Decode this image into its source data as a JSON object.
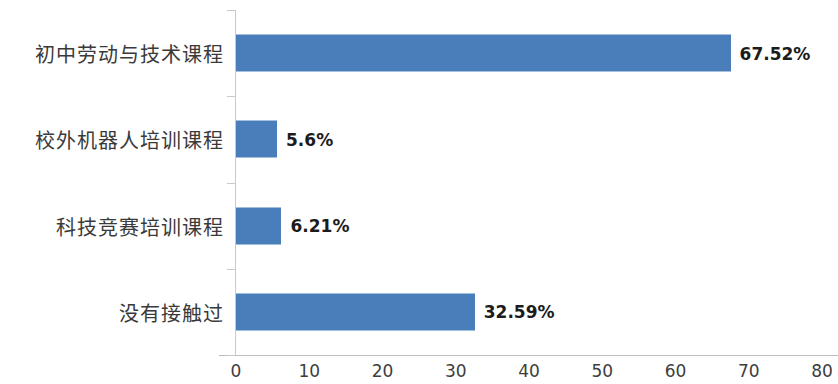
{
  "chart_data": {
    "type": "bar",
    "orientation": "horizontal",
    "title": "",
    "subtitle": "",
    "xlabel": "",
    "ylabel": "",
    "xlim": [
      0,
      80
    ],
    "ylim": null,
    "grid": false,
    "legend": null,
    "legend_position": "none",
    "bar_color": "#4a7ebb",
    "axis_color": "#c9c9c9",
    "label_color": "#3a3a3a",
    "xticks": [
      "0",
      "10",
      "20",
      "30",
      "40",
      "50",
      "60",
      "70",
      "80"
    ],
    "xtick_values": [
      0,
      10,
      20,
      30,
      40,
      50,
      60,
      70,
      80
    ],
    "categories": [
      "初中劳动与技术课程",
      "校外机器人培训课程",
      "科技竞赛培训课程",
      "没有接触过"
    ],
    "values": [
      67.52,
      5.6,
      6.21,
      32.59
    ],
    "data_labels": [
      "67.52%",
      "5.6%",
      "6.21%",
      "32.59%"
    ]
  }
}
